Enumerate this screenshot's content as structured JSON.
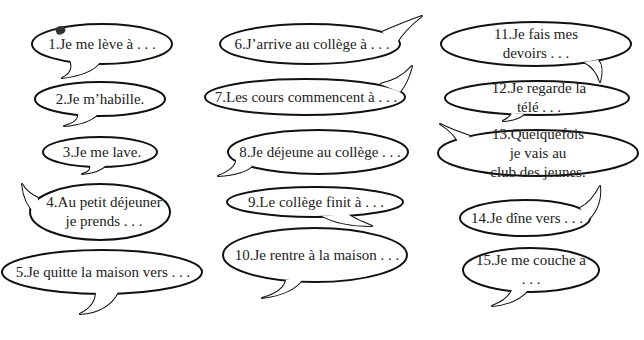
{
  "worksheet": {
    "bubbles": [
      {
        "id": 1,
        "text": "1.Je me lève à . . .",
        "cx": 102,
        "cy": 44,
        "rx": 70,
        "ry": 20,
        "tail": "M70,60 Q75,72 62,78 Q92,74 100,62",
        "tx": 102,
        "ty": 44
      },
      {
        "id": 2,
        "text": "2.Je m’habille.",
        "cx": 100,
        "cy": 99,
        "rx": 65,
        "ry": 17,
        "tail": "M78,113 Q80,122 64,126 Q88,124 98,114",
        "tx": 100,
        "ty": 99
      },
      {
        "id": 3,
        "text": "3.Je me lave.",
        "cx": 100,
        "cy": 152,
        "rx": 57,
        "ry": 15,
        "tail": "M90,165 Q92,172 82,174 Q100,172 106,165",
        "tx": 102,
        "ty": 152
      },
      {
        "id": 4,
        "text": "4.Au petit déjeuner\nje prends . . .",
        "cx": 100,
        "cy": 212,
        "rx": 70,
        "ry": 28,
        "tail": "M38,198 Q26,192 22,184 Q24,204 36,214",
        "tx": 104,
        "ty": 212
      },
      {
        "id": 5,
        "text": "5.Je quitte la maison vers . . .",
        "cx": 102,
        "cy": 272,
        "rx": 100,
        "ry": 22,
        "tail": "M96,292 Q96,306 80,314 Q108,312 118,292",
        "tx": 103,
        "ty": 272
      },
      {
        "id": 6,
        "text": "6.J’arrive au collège à . . .",
        "cx": 310,
        "cy": 44,
        "rx": 90,
        "ry": 20,
        "tail": "M382,32 Q400,24 422,16 Q404,30 396,44",
        "tx": 312,
        "ty": 44
      },
      {
        "id": 7,
        "text": "7.Les cours commencent à . . .",
        "cx": 305,
        "cy": 97,
        "rx": 100,
        "ry": 18,
        "tail": "M380,84 Q400,80 412,66 Q408,82 400,92",
        "tx": 306,
        "ty": 97
      },
      {
        "id": 8,
        "text": "8.Je déjeune au collège . . .",
        "cx": 318,
        "cy": 152,
        "rx": 90,
        "ry": 22,
        "tail": "M236,158 Q238,168 218,176 Q244,174 252,166",
        "tx": 320,
        "ty": 152
      },
      {
        "id": 9,
        "text": "9.Le collège finit à . . .",
        "cx": 315,
        "cy": 202,
        "rx": 88,
        "ry": 15,
        "tail": "M322,216 Q340,226 372,226 Q352,218 348,214",
        "tx": 316,
        "ty": 202
      },
      {
        "id": 10,
        "text": "10.Je rentre à la maison . . .",
        "cx": 315,
        "cy": 255,
        "rx": 92,
        "ry": 27,
        "tail": "M286,280 Q284,292 262,298 Q292,294 302,280",
        "tx": 317,
        "ty": 255
      },
      {
        "id": 11,
        "text": "11.Je fais mes devoirs . . .",
        "cx": 536,
        "cy": 44,
        "rx": 95,
        "ry": 22,
        "tail": "M584,62 Q596,68 600,82 Q604,66 598,60",
        "tx": 536,
        "ty": 44
      },
      {
        "id": 12,
        "text": "12.Je regarde la télé . . .",
        "cx": 537,
        "cy": 98,
        "rx": 92,
        "ry": 17,
        "tail": "M512,113 Q510,118 503,121 Q518,120 524,114",
        "tx": 539,
        "ty": 98
      },
      {
        "id": 13,
        "text": "13.Quelquefois je vais au\nclub des jeunes.",
        "cx": 538,
        "cy": 153,
        "rx": 100,
        "ry": 23,
        "tail": "M470,136 Q452,130 440,124 Q456,134 460,146",
        "tx": 538,
        "ty": 153
      },
      {
        "id": 14,
        "text": "14.Je dîne vers . . .",
        "cx": 525,
        "cy": 218,
        "rx": 65,
        "ry": 18,
        "tail": "M580,208 Q592,202 600,186 Q602,206 588,220",
        "tx": 527,
        "ty": 218
      },
      {
        "id": 15,
        "text": "15.Je me couche à . . .",
        "cx": 531,
        "cy": 270,
        "rx": 68,
        "ry": 22,
        "tail": "M512,290 Q508,300 492,306 Q516,304 528,290",
        "tx": 531,
        "ty": 270
      }
    ],
    "colors": {
      "outline": "#111111",
      "fill": "#ffffff",
      "text": "#222222"
    }
  }
}
